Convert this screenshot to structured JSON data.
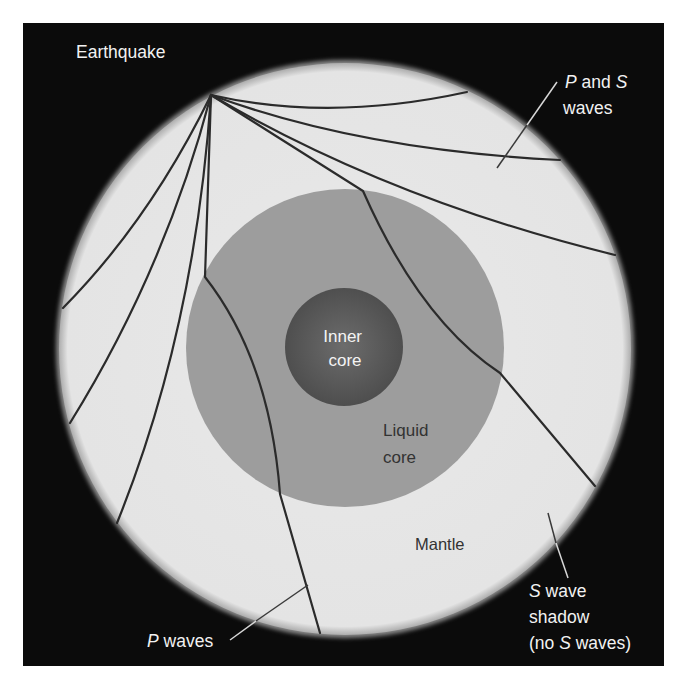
{
  "diagram": {
    "type": "earth-cross-section-seismic-waves",
    "colors": {
      "page_background": "#ffffff",
      "panel_background": "#0b0b0b",
      "mantle": "#e7e7e7",
      "mantle_edge": "#b8b8b8",
      "liquid_core": "#9d9d9d",
      "inner_core_center": "#6a6a6a",
      "inner_core_edge": "#4f4f4f",
      "wave_line": "#2b2b2b",
      "leader_line_dark": "#3a3a3a",
      "leader_line_light": "#d8d8d8",
      "label_light": "#f2f2f2",
      "label_dark": "#333333"
    },
    "layers": [
      {
        "name": "Mantle",
        "role": "mantle"
      },
      {
        "name": "Liquid core",
        "role": "outer-core"
      },
      {
        "name": "Inner core",
        "role": "inner-core"
      }
    ],
    "labels": {
      "earthquake": "Earthquake",
      "p_and_s_line1_italic": "P",
      "p_and_s_line1_rest": " and ",
      "p_and_s_line1_italic2": "S",
      "p_and_s_line2": "waves",
      "inner_core_line1": "Inner",
      "inner_core_line2": "core",
      "liquid_core_line1": "Liquid",
      "liquid_core_line2": "core",
      "mantle": "Mantle",
      "p_waves_italic": "P",
      "p_waves_rest": " waves",
      "s_shadow_line1_italic": "S",
      "s_shadow_line1_rest": " wave",
      "s_shadow_line2": "shadow",
      "s_shadow_line3_pre": "(no ",
      "s_shadow_line3_italic": "S",
      "s_shadow_line3_post": " waves)"
    }
  }
}
